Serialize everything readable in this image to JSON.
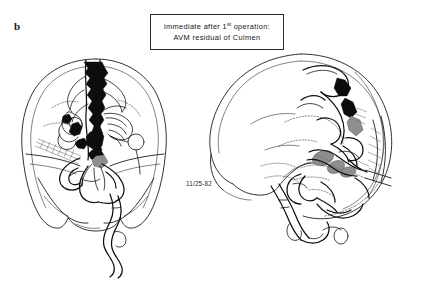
{
  "figure": {
    "panel_label": "b",
    "background_color": "#ffffff",
    "ink_color": "#101010",
    "shade_color": "#8e8e8e"
  },
  "caption": {
    "line1_prefix": "immediate after 1",
    "line1_sup": "st",
    "line1_suffix": " operation:",
    "line2": "AVM residual of Culmen"
  },
  "annotations": {
    "date_stamp": "11/25-82"
  },
  "drawings": [
    {
      "id": "ap-view",
      "name": "skull-ap-angiogram",
      "view": "anteroposterior",
      "description": "Skull outline with cerebral arteriovenous malformation nidus and draining veins"
    },
    {
      "id": "lateral-view",
      "name": "skull-lateral-angiogram",
      "view": "lateral",
      "description": "Lateral skull outline with craniotomy flap, residual AVM nidus shaded and vascular tree"
    }
  ]
}
